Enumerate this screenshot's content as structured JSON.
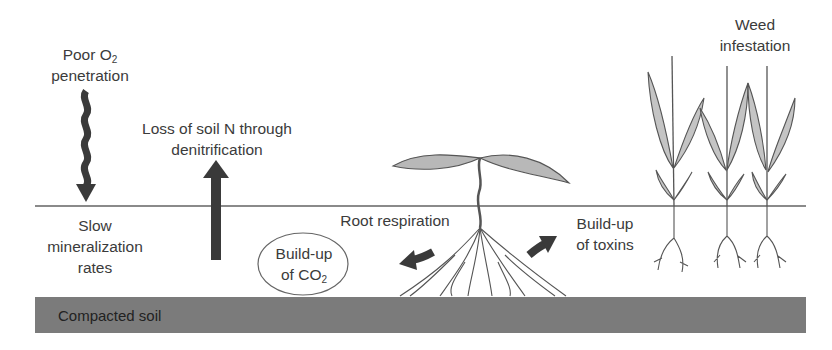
{
  "diagram": {
    "title": "",
    "colors": {
      "text": "#3b3b3b",
      "ground_line": "#8a8a8a",
      "soil_band": "#7b7b7b",
      "arrow": "#3a3a3a",
      "leaf_fill": "#b8b8b8",
      "leaf_stroke": "#555555"
    },
    "labels": {
      "poor_o2": {
        "line1_prefix": "Poor O",
        "line1_sub": "2",
        "line2": "penetration"
      },
      "loss_n": {
        "line1": "Loss of soil N through",
        "line2": "denitrification"
      },
      "slow_min": {
        "line1": "Slow",
        "line2": "mineralization",
        "line3": "rates"
      },
      "co2": {
        "line1": "Build-up",
        "line2_prefix": "of CO",
        "line2_sub": "2"
      },
      "root_resp": "Root respiration",
      "toxins": {
        "line1": "Build-up",
        "line2": "of toxins"
      },
      "weeds": {
        "line1": "Weed",
        "line2": "infestation"
      },
      "soil": "Compacted soil"
    },
    "icons": [
      "wavy-down-arrow-icon",
      "up-arrow-icon",
      "curved-left-arrow-icon",
      "curved-right-arrow-icon",
      "seedling-icon",
      "weed-plant-icon"
    ]
  }
}
